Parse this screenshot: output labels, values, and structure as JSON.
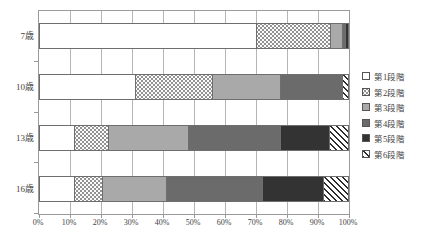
{
  "chart_data": {
    "type": "bar",
    "orientation": "horizontal",
    "stacked": true,
    "normalized_percent": true,
    "title": "",
    "xlabel": "",
    "ylabel": "",
    "xlim": [
      0,
      100
    ],
    "xtick_labels": [
      "0%",
      "10%",
      "20%",
      "30%",
      "40%",
      "50%",
      "60%",
      "70%",
      "80%",
      "90%",
      "100%"
    ],
    "xtick_values": [
      0,
      10,
      20,
      30,
      40,
      50,
      60,
      70,
      80,
      90,
      100
    ],
    "grid": true,
    "grid_axis": "x",
    "legend_position": "right",
    "categories": [
      "7歳",
      "10歳",
      "13歳",
      "16歳"
    ],
    "series": [
      {
        "name": "第1段階",
        "pattern": "white",
        "color": "#ffffff",
        "values": [
          70,
          31,
          11,
          11
        ]
      },
      {
        "name": "第2段階",
        "pattern": "dotted",
        "color": "#fbfbfb",
        "values": [
          24,
          25,
          11,
          9
        ]
      },
      {
        "name": "第3段階",
        "pattern": "light-gray",
        "color": "#a9a9a9",
        "values": [
          4,
          22,
          26,
          21
        ]
      },
      {
        "name": "第4段階",
        "pattern": "medium-gray",
        "color": "#6b6b6b",
        "values": [
          1,
          20,
          30,
          31
        ]
      },
      {
        "name": "第5段階",
        "pattern": "dark",
        "color": "#333333",
        "values": [
          1,
          0,
          16,
          20
        ]
      },
      {
        "name": "第6段階",
        "pattern": "diagonal-hatch",
        "color": "#2e2e2e",
        "values": [
          0,
          2,
          6,
          8
        ]
      }
    ]
  },
  "legend": {
    "items": [
      {
        "label": "第1段階"
      },
      {
        "label": "第2段階"
      },
      {
        "label": "第3段階"
      },
      {
        "label": "第4段階"
      },
      {
        "label": "第5段階"
      },
      {
        "label": "第6段階"
      }
    ]
  }
}
